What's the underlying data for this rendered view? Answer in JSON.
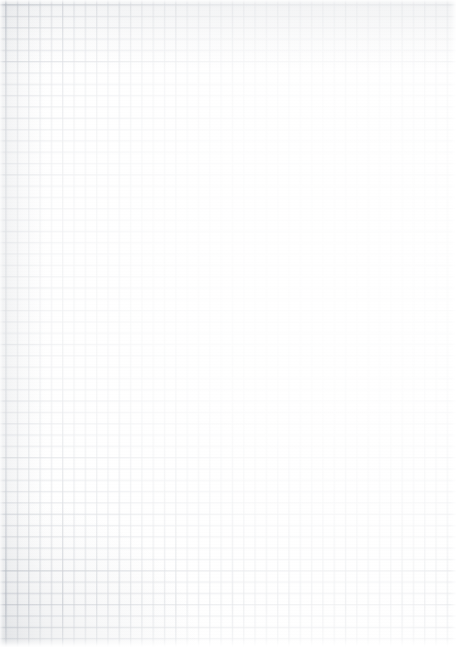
{
  "document": {
    "kind": "graph-paper-scan",
    "description": "Blank quadrille / graph paper sheet, scanned",
    "width_px": 456,
    "height_px": 647,
    "text_content": "",
    "has_text": false,
    "has_controls": false
  },
  "grid": {
    "style": "square-quadrille",
    "cell_pitch_px": 11.32,
    "major_every_n_cells": 5,
    "major_pitch_px": 56.6,
    "origin_x_px": 5.5,
    "origin_y_px": 4.5,
    "line_width_px": 1,
    "approx_columns": 40,
    "approx_rows": 57
  },
  "colors": {
    "paper": "#fefefe",
    "page_background": "#ffffff",
    "grid_line": "#969eaa",
    "grid_line_echo": "#a0a8b4",
    "grid_major": "#8e96a3",
    "shadow_tint": "#808894"
  },
  "appearance": {
    "illumination": "brightest toward centre-right, darkest at top edge, left edge and bottom-left corner",
    "fade_direction": "left-to-right and top-to-bottom wash",
    "darkest_corner": "bottom-left",
    "lightest_region": "centre-right",
    "edge_blowout": "outer border washes to white",
    "grain": "faint paper texture"
  }
}
